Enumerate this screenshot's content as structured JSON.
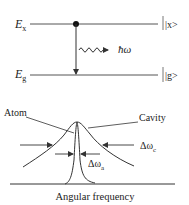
{
  "energy_diagram": {
    "upper_level_label": "E",
    "upper_level_subscript": "x",
    "lower_level_label": "E",
    "lower_level_subscript": "g",
    "upper_state_ket": "|x>",
    "lower_state_ket": "|g>",
    "photon_label": "ħω"
  },
  "spectrum_diagram": {
    "atom_label": "Atom",
    "cavity_label": "Cavity",
    "cavity_linewidth_label": "Δω",
    "cavity_linewidth_subscript": "c",
    "atom_linewidth_label": "Δω",
    "atom_linewidth_subscript": "a",
    "x_axis_label": "Angular frequency"
  },
  "colors": {
    "line": "#333333",
    "text": "#222222"
  }
}
